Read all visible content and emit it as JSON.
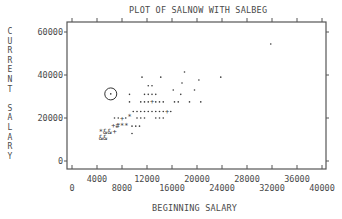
{
  "chart_data": {
    "type": "scatter",
    "title": "PLOT OF SALNOW WITH SALBEG",
    "xlabel": "BEGINNING SALARY",
    "ylabel": "CURRENT SALARY",
    "xlim": [
      0,
      40000
    ],
    "ylim": [
      0,
      60000
    ],
    "x_ticks_lower": [
      "0",
      "8000",
      "16000",
      "24000",
      "32000",
      "40000"
    ],
    "x_ticks_upper": [
      "4000",
      "12000",
      "20000",
      "28000",
      "36000"
    ],
    "y_ticks": [
      "0",
      "20000",
      "40000",
      "60000"
    ],
    "grid": false,
    "legend": null,
    "annotations": [
      {
        "type": "circle",
        "x": 6200,
        "y": 31200,
        "note": "highlighted point"
      }
    ],
    "symbol_note": "SPSS-style character plot; '+' '*' '#' '&' denote overlapping cases",
    "points": [
      {
        "x": 31800,
        "y": 54400,
        "sym": "."
      },
      {
        "x": 11200,
        "y": 39000,
        "sym": "."
      },
      {
        "x": 14200,
        "y": 39000,
        "sym": "."
      },
      {
        "x": 18000,
        "y": 41400,
        "sym": "."
      },
      {
        "x": 17600,
        "y": 36300,
        "sym": "."
      },
      {
        "x": 20300,
        "y": 37700,
        "sym": "."
      },
      {
        "x": 23800,
        "y": 39000,
        "sym": "."
      },
      {
        "x": 12200,
        "y": 35000,
        "sym": "."
      },
      {
        "x": 12800,
        "y": 35000,
        "sym": "."
      },
      {
        "x": 16200,
        "y": 33000,
        "sym": "."
      },
      {
        "x": 19600,
        "y": 33000,
        "sym": "."
      },
      {
        "x": 6200,
        "y": 31200,
        "sym": "."
      },
      {
        "x": 9200,
        "y": 31000,
        "sym": "."
      },
      {
        "x": 11600,
        "y": 31000,
        "sym": "."
      },
      {
        "x": 12200,
        "y": 31000,
        "sym": "."
      },
      {
        "x": 12800,
        "y": 31000,
        "sym": "."
      },
      {
        "x": 13400,
        "y": 31000,
        "sym": "."
      },
      {
        "x": 17400,
        "y": 31000,
        "sym": "."
      },
      {
        "x": 9200,
        "y": 27500,
        "sym": "."
      },
      {
        "x": 11000,
        "y": 27500,
        "sym": "."
      },
      {
        "x": 11600,
        "y": 27500,
        "sym": "."
      },
      {
        "x": 12200,
        "y": 27500,
        "sym": "."
      },
      {
        "x": 12800,
        "y": 27500,
        "sym": "+"
      },
      {
        "x": 13400,
        "y": 27500,
        "sym": "."
      },
      {
        "x": 14000,
        "y": 27500,
        "sym": "."
      },
      {
        "x": 14600,
        "y": 27500,
        "sym": "."
      },
      {
        "x": 16400,
        "y": 27500,
        "sym": "."
      },
      {
        "x": 17000,
        "y": 27500,
        "sym": "."
      },
      {
        "x": 18800,
        "y": 27500,
        "sym": "."
      },
      {
        "x": 20600,
        "y": 27500,
        "sym": "."
      },
      {
        "x": 9800,
        "y": 23000,
        "sym": "."
      },
      {
        "x": 10400,
        "y": 23000,
        "sym": "."
      },
      {
        "x": 11000,
        "y": 23000,
        "sym": "."
      },
      {
        "x": 11600,
        "y": 23000,
        "sym": "."
      },
      {
        "x": 12200,
        "y": 23000,
        "sym": "."
      },
      {
        "x": 12800,
        "y": 23000,
        "sym": "."
      },
      {
        "x": 13400,
        "y": 23000,
        "sym": "."
      },
      {
        "x": 14000,
        "y": 23000,
        "sym": "."
      },
      {
        "x": 14600,
        "y": 23000,
        "sym": "."
      },
      {
        "x": 15200,
        "y": 23000,
        "sym": "+"
      },
      {
        "x": 15800,
        "y": 23000,
        "sym": "."
      },
      {
        "x": 6800,
        "y": 20000,
        "sym": "."
      },
      {
        "x": 7400,
        "y": 20000,
        "sym": "."
      },
      {
        "x": 8000,
        "y": 20000,
        "sym": "+"
      },
      {
        "x": 8600,
        "y": 20000,
        "sym": "."
      },
      {
        "x": 9200,
        "y": 20800,
        "sym": "*"
      },
      {
        "x": 10400,
        "y": 20000,
        "sym": "."
      },
      {
        "x": 11000,
        "y": 20000,
        "sym": "."
      },
      {
        "x": 11600,
        "y": 20000,
        "sym": "."
      },
      {
        "x": 13400,
        "y": 20000,
        "sym": "."
      },
      {
        "x": 14000,
        "y": 20000,
        "sym": "."
      },
      {
        "x": 14600,
        "y": 20000,
        "sym": "."
      },
      {
        "x": 6600,
        "y": 16700,
        "sym": "+"
      },
      {
        "x": 7300,
        "y": 16700,
        "sym": "#"
      },
      {
        "x": 8000,
        "y": 16700,
        "sym": "*"
      },
      {
        "x": 8700,
        "y": 16700,
        "sym": "*"
      },
      {
        "x": 9600,
        "y": 16200,
        "sym": "."
      },
      {
        "x": 10200,
        "y": 16200,
        "sym": "."
      },
      {
        "x": 10800,
        "y": 16200,
        "sym": "."
      },
      {
        "x": 4600,
        "y": 13600,
        "sym": "*"
      },
      {
        "x": 5300,
        "y": 13600,
        "sym": "&"
      },
      {
        "x": 6000,
        "y": 13600,
        "sym": "&"
      },
      {
        "x": 6800,
        "y": 13600,
        "sym": "+"
      },
      {
        "x": 9600,
        "y": 12800,
        "sym": "."
      },
      {
        "x": 4600,
        "y": 10700,
        "sym": "&"
      },
      {
        "x": 5300,
        "y": 10700,
        "sym": "&"
      }
    ]
  },
  "page": {
    "title": "PLOT OF SALNOW WITH SALBEG",
    "ylabel_letters": [
      "C",
      "U",
      "R",
      "R",
      "E",
      "N",
      "T",
      " ",
      "S",
      "A",
      "L",
      "A",
      "R",
      "Y"
    ],
    "xlabel": "BEGINNING SALARY"
  },
  "colors": {
    "axis": "#555555",
    "text": "#4a4a4a",
    "background": "#ffffff"
  }
}
